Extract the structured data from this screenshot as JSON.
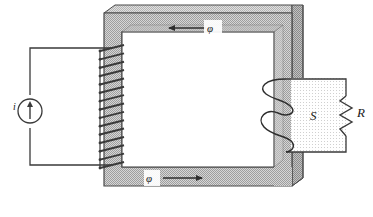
{
  "figure": {
    "background_color": "#ffffff",
    "width": 373,
    "height": 217
  },
  "core": {
    "name": "magnetic-core",
    "face_color": "#c9c9c9",
    "top_bevel_color": "#d8d8d8",
    "side_bevel_color": "#b0b0b0",
    "inner_window_color": "#ffffff",
    "outline_color": "#4a4a4a"
  },
  "primary": {
    "source_label": "i",
    "source_icon": "current-source-icon",
    "coil_icon": "primary-coil-icon",
    "turns": 15,
    "wire_color": "#3a3a3a"
  },
  "secondary": {
    "coil_icon": "secondary-coil-icon",
    "turns": 2,
    "region_label": "S",
    "region_color": "#f2f2f2",
    "resistor_label": "R",
    "resistor_icon": "resistor-icon",
    "wire_color": "#3a3a3a"
  },
  "flux": {
    "top": {
      "label": "φ",
      "direction": "left",
      "arrow_icon": "arrow-left-icon"
    },
    "bottom": {
      "label": "φ",
      "direction": "right",
      "arrow_icon": "arrow-right-icon"
    },
    "color": "#2e2e2e"
  }
}
